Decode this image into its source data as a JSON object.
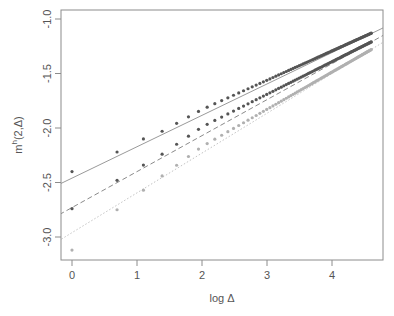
{
  "chart_data": {
    "type": "scatter",
    "title": "",
    "xlabel": "log Δ",
    "ylabel": "m^h(2,Δ)",
    "ylabel_main": "m",
    "ylabel_sup": "h",
    "ylabel_rest": "(2,Δ)",
    "xlim": [
      -0.2,
      4.8
    ],
    "ylim": [
      -3.22,
      -0.92
    ],
    "x_ticks": [
      0,
      1,
      2,
      3,
      4
    ],
    "x_tick_labels": [
      "0",
      "1",
      "2",
      "3",
      "4"
    ],
    "y_ticks": [
      -1.0,
      -1.5,
      -2.0,
      -2.5,
      -3.0
    ],
    "y_tick_labels": [
      "-1.0",
      "-1.5",
      "-2.0",
      "-2.5",
      "-3.0"
    ],
    "grid": false,
    "legend": null,
    "x_note": "points at log(Δ) for Δ = 1..100",
    "series": [
      {
        "name": "series 1",
        "point_color": "#555555",
        "line_color": "#9a9a9a",
        "line_style": "solid",
        "fit": {
          "intercept": -2.46,
          "slope": 0.288
        },
        "sample_points": [
          [
            0,
            -2.4
          ],
          [
            0.693,
            -2.22
          ],
          [
            1.099,
            -2.1
          ],
          [
            1.386,
            -2.03
          ],
          [
            2.0,
            -1.83
          ],
          [
            4.605,
            -1.13
          ]
        ]
      },
      {
        "name": "series 2",
        "point_color": "#555555",
        "line_color": "#8a8a8a",
        "line_style": "dashed",
        "fit": {
          "intercept": -2.73,
          "slope": 0.33
        },
        "sample_points": [
          [
            0,
            -2.74
          ],
          [
            0.693,
            -2.48
          ],
          [
            1.099,
            -2.34
          ],
          [
            1.386,
            -2.24
          ],
          [
            2.0,
            -1.99
          ],
          [
            4.605,
            -1.21
          ]
        ]
      },
      {
        "name": "series 3",
        "point_color": "#b0b0b0",
        "line_color": "#c4c4c4",
        "line_style": "dotted",
        "fit": {
          "intercept": -2.96,
          "slope": 0.365
        },
        "sample_points": [
          [
            0,
            -3.12
          ],
          [
            0.693,
            -2.75
          ],
          [
            1.099,
            -2.57
          ],
          [
            1.386,
            -2.44
          ],
          [
            2.0,
            -2.17
          ],
          [
            4.605,
            -1.28
          ]
        ]
      }
    ]
  }
}
